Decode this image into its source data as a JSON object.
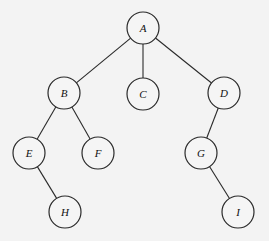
{
  "diagram": {
    "type": "tree",
    "node_radius": 16,
    "nodes": [
      {
        "id": "A",
        "label": "A",
        "x": 143,
        "y": 28
      },
      {
        "id": "B",
        "label": "B",
        "x": 64,
        "y": 93
      },
      {
        "id": "C",
        "label": "C",
        "x": 143,
        "y": 94
      },
      {
        "id": "D",
        "label": "D",
        "x": 224,
        "y": 93
      },
      {
        "id": "E",
        "label": "E",
        "x": 29,
        "y": 153
      },
      {
        "id": "F",
        "label": "F",
        "x": 98,
        "y": 153
      },
      {
        "id": "G",
        "label": "G",
        "x": 201,
        "y": 153
      },
      {
        "id": "H",
        "label": "H",
        "x": 65,
        "y": 212
      },
      {
        "id": "I",
        "label": "I",
        "x": 238,
        "y": 212
      }
    ],
    "edges": [
      [
        "A",
        "B"
      ],
      [
        "A",
        "C"
      ],
      [
        "A",
        "D"
      ],
      [
        "B",
        "E"
      ],
      [
        "B",
        "F"
      ],
      [
        "D",
        "G"
      ],
      [
        "E",
        "H"
      ],
      [
        "G",
        "I"
      ]
    ]
  }
}
